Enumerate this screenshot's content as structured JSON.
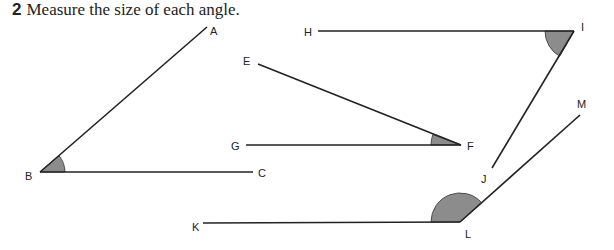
{
  "question": {
    "number": "2",
    "text": "Measure the size of each angle."
  },
  "angles": [
    {
      "name": "ABC",
      "vertex": "B",
      "arms": [
        "A",
        "C"
      ]
    },
    {
      "name": "EFG",
      "vertex": "F",
      "arms": [
        "E",
        "G"
      ]
    },
    {
      "name": "HIJ",
      "vertex": "I",
      "arms": [
        "H",
        "J"
      ]
    },
    {
      "name": "KLM",
      "vertex": "L",
      "arms": [
        "K",
        "M"
      ]
    }
  ],
  "labels": {
    "A": "A",
    "B": "B",
    "C": "C",
    "E": "E",
    "F": "F",
    "G": "G",
    "H": "H",
    "I": "I",
    "J": "J",
    "K": "K",
    "L": "L",
    "M": "M"
  },
  "colors": {
    "arc_fill": "#8c8c8c",
    "line": "#222222"
  }
}
